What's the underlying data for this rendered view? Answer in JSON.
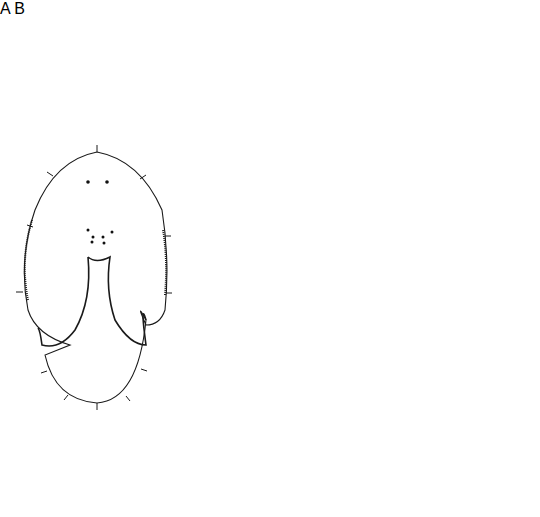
{
  "figure": {
    "panels": [
      {
        "id": "A",
        "label": "A",
        "description": "Outline of whole specimen, dorsal view with eyes, sensory bristles and ciliated margins"
      },
      {
        "id": "B",
        "label": "B",
        "description": "Internal anatomy showing gonads, pharynx and reproductive ducts"
      }
    ],
    "colors": {
      "line": "#1a1a1a",
      "background": "#ffffff",
      "dense_stipple": "#222222"
    }
  }
}
